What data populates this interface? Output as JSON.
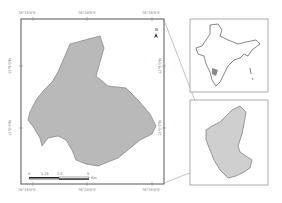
{
  "main_map": {
    "top_labels": [
      "76°15'0\"E",
      "76°20'0\"E",
      "76°25'0\"E"
    ],
    "bottom_labels": [
      "76°15'0\"E",
      "76°20'0\"E",
      "76°25'0\"E"
    ],
    "left_labels": [
      "12°5'0\"N",
      "12°0'0\"N"
    ],
    "right_labels": [
      "12°5'0\"N",
      "12°0'0\"N"
    ],
    "north_arrow": "N",
    "scale_bar": {
      "ticks": [
        "0",
        "1.25",
        "2.5",
        "",
        "5"
      ],
      "unit": "Km"
    },
    "colors": {
      "fill": "#b9b9b9",
      "stroke": "#8a8a8a",
      "frame": "#555555"
    }
  },
  "insets": [
    {
      "name": "India",
      "fill": "#ffffff"
    },
    {
      "name": "Karnataka",
      "fill": "#cfcfcf"
    }
  ]
}
